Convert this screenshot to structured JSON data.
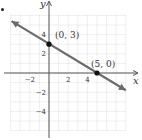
{
  "chart_data": {
    "type": "line",
    "title": "",
    "xlabel": "x",
    "ylabel": "y",
    "xlim": [
      -4,
      8
    ],
    "ylim": [
      -6,
      6
    ],
    "grid": true,
    "x_ticks": [
      {
        "value": -2,
        "label": "−2"
      },
      {
        "value": 2,
        "label": "2"
      },
      {
        "value": 4,
        "label": "4"
      }
    ],
    "y_ticks": [
      {
        "value": 4,
        "label": "4"
      },
      {
        "value": 2,
        "label": "2"
      },
      {
        "value": -2,
        "label": "−2"
      },
      {
        "value": -4,
        "label": "−4"
      }
    ],
    "series": [
      {
        "name": "line",
        "equation": "y = -3/5 x + 3",
        "x": [
          -4,
          8
        ],
        "y": [
          5.4,
          -1.8
        ],
        "arrows": "both",
        "color": "#6b6b6b"
      }
    ],
    "points": [
      {
        "x": 0,
        "y": 3,
        "label": "(0, 3)"
      },
      {
        "x": 5,
        "y": 0,
        "label": "(5, 0)"
      }
    ]
  },
  "colors": {
    "grid": "#c9c9c9",
    "axis": "#555555",
    "line": "#6b6b6b",
    "point": "#111111",
    "text": "#333333"
  }
}
